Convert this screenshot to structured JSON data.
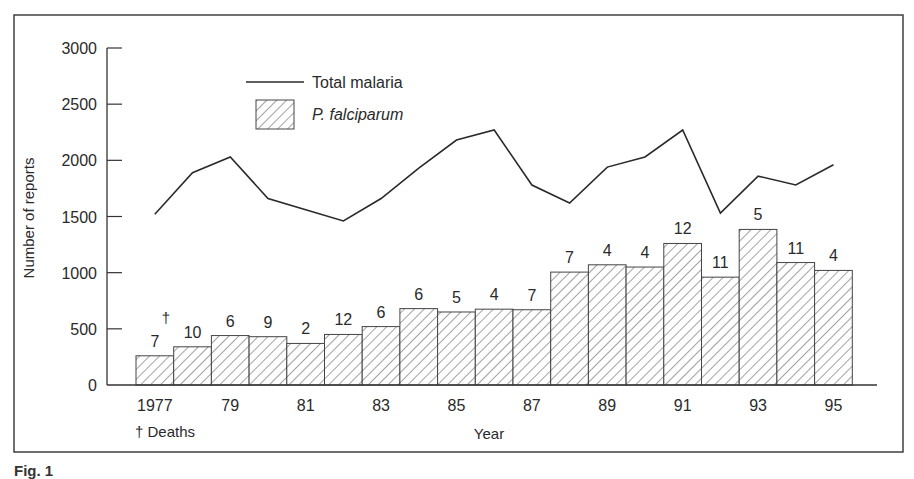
{
  "chart_data": {
    "type": "bar",
    "title": "",
    "xlabel": "Year",
    "ylabel": "Number of reports",
    "ylim": [
      0,
      3000
    ],
    "yticks": [
      0,
      500,
      1000,
      1500,
      2000,
      2500,
      3000
    ],
    "categories": [
      "1977",
      "1978",
      "1979",
      "1980",
      "1981",
      "1982",
      "1983",
      "1984",
      "1985",
      "1986",
      "1987",
      "1988",
      "1989",
      "1990",
      "1991",
      "1992",
      "1993",
      "1994",
      "1995"
    ],
    "xtick_labels": [
      {
        "index": 0,
        "label": "1977"
      },
      {
        "index": 2,
        "label": "79"
      },
      {
        "index": 4,
        "label": "81"
      },
      {
        "index": 6,
        "label": "83"
      },
      {
        "index": 8,
        "label": "85"
      },
      {
        "index": 10,
        "label": "87"
      },
      {
        "index": 12,
        "label": "89"
      },
      {
        "index": 14,
        "label": "91"
      },
      {
        "index": 16,
        "label": "93"
      },
      {
        "index": 18,
        "label": "95"
      }
    ],
    "series": [
      {
        "name": "Total malaria",
        "type": "line",
        "values": [
          1520,
          1890,
          2030,
          1660,
          1560,
          1460,
          1660,
          1930,
          2180,
          2270,
          1780,
          1620,
          1940,
          2030,
          2270,
          1530,
          1860,
          1780,
          1960
        ]
      },
      {
        "name": "P. falciparum",
        "type": "bar",
        "pattern": "diagonal-hatch",
        "values": [
          260,
          340,
          440,
          430,
          370,
          450,
          520,
          680,
          650,
          675,
          670,
          1005,
          1070,
          1050,
          1260,
          960,
          1385,
          1090,
          1020
        ]
      }
    ],
    "annotations": {
      "deaths_per_year": [
        "7",
        "10",
        "6",
        "9",
        "2",
        "12",
        "6",
        "6",
        "5",
        "4",
        "7",
        "7",
        "4",
        "4",
        "12",
        "11",
        "5",
        "11",
        "4"
      ],
      "dagger_symbol": "†",
      "dagger_note": "† Deaths"
    },
    "legend": {
      "position": "upper-left-inside",
      "entries": [
        {
          "label": "Total malaria",
          "marker": "line"
        },
        {
          "label": "P. falciparum",
          "marker": "hatched-box",
          "italic": true
        }
      ]
    },
    "grid": false
  },
  "caption": {
    "text": "Fig. 1"
  },
  "colors": {
    "ink": "#2a2a2a",
    "background": "#ffffff",
    "hatch": "#555555"
  }
}
